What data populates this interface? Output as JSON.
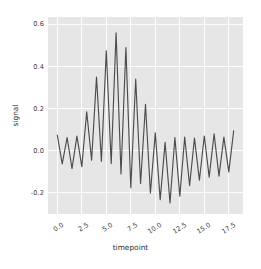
{
  "chart_data": {
    "type": "line",
    "title": "",
    "xlabel": "timepoint",
    "ylabel": "signal",
    "xlim": [
      -0.95,
      18.95
    ],
    "ylim": [
      -0.3,
      0.635
    ],
    "grid": true,
    "legend": null,
    "xticks": [
      "0.0",
      "2.5",
      "5.0",
      "7.5",
      "10.0",
      "12.5",
      "15.0",
      "17.5"
    ],
    "xtick_values": [
      0.0,
      2.5,
      5.0,
      7.5,
      10.0,
      12.5,
      15.0,
      17.5
    ],
    "yticks": [
      "0.6",
      "0.4",
      "0.2",
      "0.0",
      "-0.2"
    ],
    "ytick_values": [
      0.6,
      0.4,
      0.2,
      0.0,
      -0.2
    ],
    "line_color": "#4c4c4c",
    "axes_facecolor": "#e6e6e6",
    "grid_color": "#ffffff",
    "series": [
      {
        "name": "signal",
        "x": [
          0.0,
          0.5,
          1.0,
          1.5,
          2.0,
          2.5,
          3.0,
          3.5,
          4.0,
          4.5,
          5.0,
          5.5,
          6.0,
          6.5,
          7.0,
          7.5,
          8.0,
          8.5,
          9.0,
          9.5,
          10.0,
          10.5,
          11.0,
          11.5,
          12.0,
          12.5,
          13.0,
          13.5,
          14.0,
          14.5,
          15.0,
          15.5,
          16.0,
          16.5,
          17.0,
          17.5,
          18.0
        ],
        "y": [
          0.075,
          -0.062,
          0.063,
          -0.085,
          0.07,
          -0.075,
          0.185,
          -0.045,
          0.35,
          -0.05,
          0.475,
          -0.06,
          0.56,
          -0.11,
          0.49,
          -0.175,
          0.34,
          -0.155,
          0.22,
          -0.2,
          0.085,
          -0.232,
          0.04,
          -0.248,
          0.063,
          -0.215,
          0.065,
          -0.165,
          0.06,
          -0.14,
          0.07,
          -0.125,
          0.08,
          -0.12,
          0.065,
          -0.1,
          0.095
        ]
      }
    ]
  }
}
